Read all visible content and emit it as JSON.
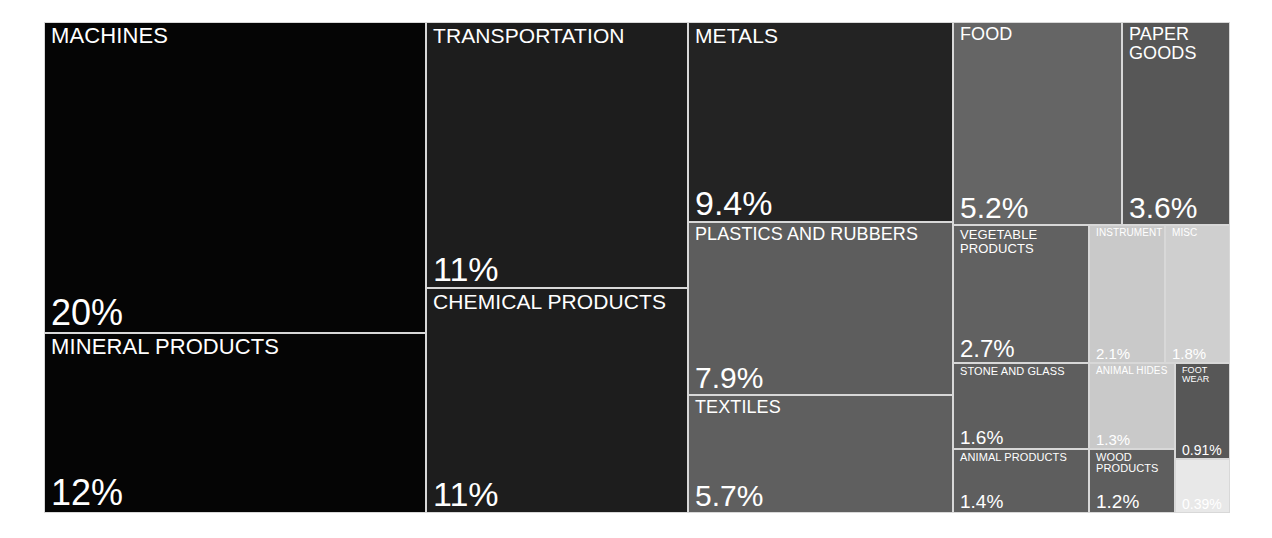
{
  "chart_data": {
    "type": "treemap",
    "title": "",
    "subtitle": "",
    "xlabel": "",
    "ylabel": "",
    "legend": "none",
    "grid": false,
    "value_unit": "percent",
    "border_color": "#d8d8d8",
    "background": "#ffffff",
    "label_color": "#ffffff",
    "categories": [
      "MACHINES",
      "MINERAL PRODUCTS",
      "TRANSPORTATION",
      "CHEMICAL PRODUCTS",
      "METALS",
      "PLASTICS AND RUBBERS",
      "TEXTILES",
      "FOOD",
      "VEGETABLE PRODUCTS",
      "STONE AND GLASS",
      "ANIMAL PRODUCTS",
      "PAPER GOODS",
      "INSTRUMENT",
      "MISC",
      "ANIMAL HIDES",
      "WOOD PRODUCTS",
      "FOOT WEAR",
      ""
    ],
    "values": [
      20,
      12,
      11,
      11,
      9.4,
      7.9,
      5.7,
      5.2,
      2.7,
      1.6,
      1.4,
      3.6,
      2.1,
      1.8,
      1.3,
      1.2,
      0.91,
      0.39
    ],
    "tiles": [
      {
        "name": "MACHINES",
        "value": "20%",
        "color": "#050505",
        "x": 0,
        "y": 0,
        "w": 382,
        "h": 311,
        "size": "s-xl"
      },
      {
        "name": "MINERAL PRODUCTS",
        "value": "12%",
        "color": "#050505",
        "x": 0,
        "y": 311,
        "w": 382,
        "h": 180,
        "size": "s-xl"
      },
      {
        "name": "TRANSPORTATION",
        "value": "11%",
        "color": "#1d1d1d",
        "x": 382,
        "y": 0,
        "w": 262,
        "h": 266,
        "size": "s-lg"
      },
      {
        "name": "CHEMICAL PRODUCTS",
        "value": "11%",
        "color": "#1d1d1d",
        "x": 382,
        "y": 266,
        "w": 262,
        "h": 225,
        "size": "s-lg"
      },
      {
        "name": "METALS",
        "value": "9.4%",
        "color": "#232323",
        "x": 644,
        "y": 0,
        "w": 265,
        "h": 200,
        "size": "s-lg"
      },
      {
        "name": "PLASTICS AND RUBBERS",
        "value": "7.9%",
        "color": "#5d5d5d",
        "x": 644,
        "y": 200,
        "w": 265,
        "h": 173,
        "size": "s-md"
      },
      {
        "name": "TEXTILES",
        "value": "5.7%",
        "color": "#5f5f5f",
        "x": 644,
        "y": 373,
        "w": 265,
        "h": 118,
        "size": "s-md"
      },
      {
        "name": "FOOD",
        "value": "5.2%",
        "color": "#656565",
        "x": 909,
        "y": 0,
        "w": 169,
        "h": 203,
        "size": "s-md"
      },
      {
        "name": "VEGETABLE PRODUCTS",
        "value": "2.7%",
        "color": "#616161",
        "x": 909,
        "y": 203,
        "w": 136,
        "h": 138,
        "size": "s-sm"
      },
      {
        "name": "STONE AND GLASS",
        "value": "1.6%",
        "color": "#5e5e5e",
        "x": 909,
        "y": 341,
        "w": 136,
        "h": 86,
        "size": "s-xs"
      },
      {
        "name": "ANIMAL PRODUCTS",
        "value": "1.4%",
        "color": "#5e5e5e",
        "x": 909,
        "y": 427,
        "w": 136,
        "h": 64,
        "size": "s-xs"
      },
      {
        "name": "PAPER GOODS",
        "value": "3.6%",
        "color": "#575757",
        "x": 1078,
        "y": 0,
        "w": 108,
        "h": 203,
        "size": "s-md"
      },
      {
        "name": "INSTRUMENT",
        "value": "2.1%",
        "color": "#c9c9c9",
        "x": 1045,
        "y": 203,
        "w": 76,
        "h": 138,
        "size": "s-xxs"
      },
      {
        "name": "MISC",
        "value": "1.8%",
        "color": "#cfcfcf",
        "x": 1121,
        "y": 203,
        "w": 65,
        "h": 138,
        "size": "s-xxs"
      },
      {
        "name": "ANIMAL HIDES",
        "value": "1.3%",
        "color": "#c9c9c9",
        "x": 1045,
        "y": 341,
        "w": 86,
        "h": 86,
        "size": "s-xxs"
      },
      {
        "name": "WOOD PRODUCTS",
        "value": "1.2%",
        "color": "#5e5e5e",
        "x": 1045,
        "y": 427,
        "w": 86,
        "h": 64,
        "size": "s-xs"
      },
      {
        "name": "FOOT WEAR",
        "value": "0.91%",
        "color": "#575757",
        "x": 1131,
        "y": 341,
        "w": 55,
        "h": 96,
        "size": "s-tiny"
      },
      {
        "name": "",
        "value": "0.39%",
        "color": "#e8e8e8",
        "x": 1131,
        "y": 437,
        "w": 55,
        "h": 54,
        "size": "s-tiny"
      }
    ]
  }
}
